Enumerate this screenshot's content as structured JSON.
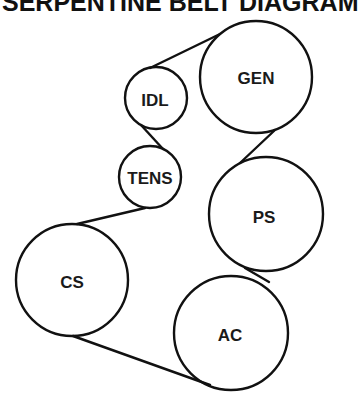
{
  "title": "SERPENTINE BELT DIAGRAM",
  "colors": {
    "stroke": "#111111",
    "background": "#ffffff"
  },
  "pulleys": [
    {
      "id": "gen",
      "label": "GEN",
      "cx": 256,
      "cy": 77,
      "r": 56
    },
    {
      "id": "idl",
      "label": "IDL",
      "cx": 156,
      "cy": 98,
      "r": 31
    },
    {
      "id": "tens",
      "label": "TENS",
      "cx": 150,
      "cy": 177,
      "r": 31
    },
    {
      "id": "ps",
      "label": "PS",
      "cx": 266,
      "cy": 214,
      "r": 57
    },
    {
      "id": "cs",
      "label": "CS",
      "cx": 72,
      "cy": 280,
      "r": 56
    },
    {
      "id": "ac",
      "label": "AC",
      "cx": 231,
      "cy": 333,
      "r": 57
    }
  ]
}
